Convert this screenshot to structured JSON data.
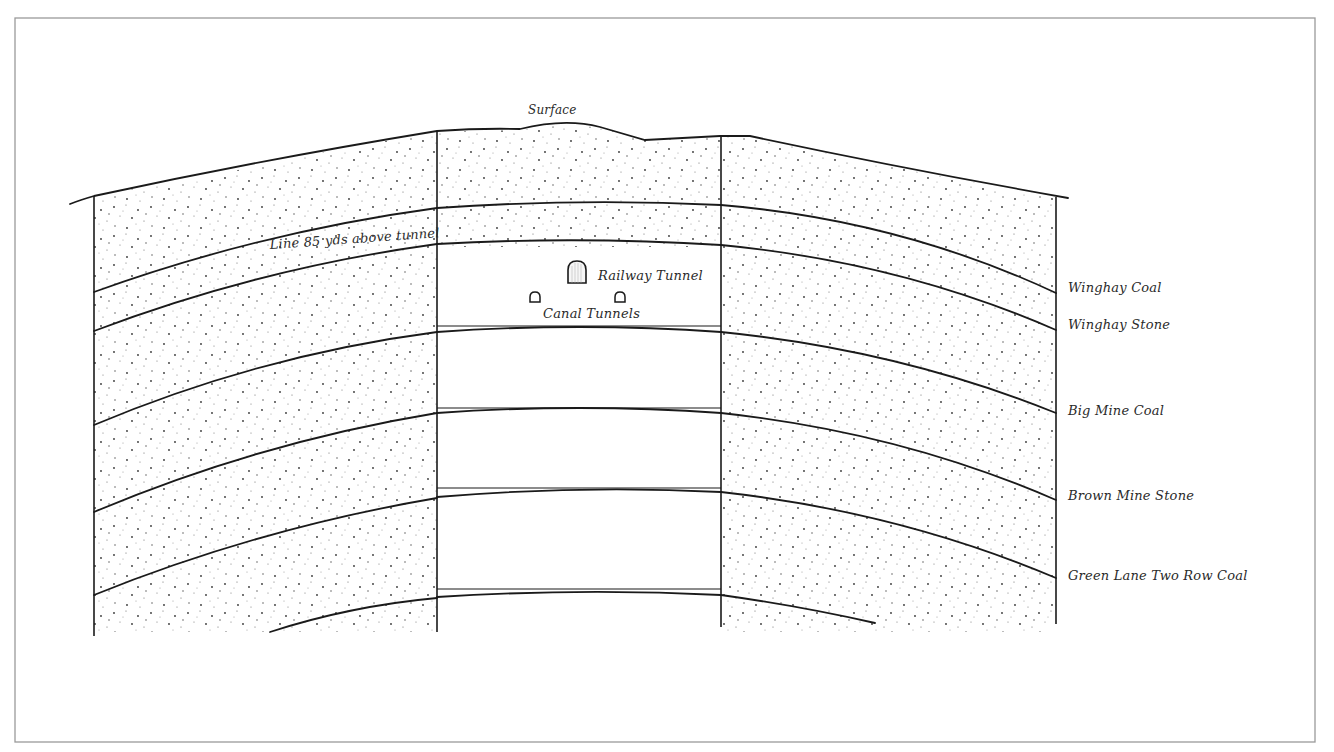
{
  "diagram": {
    "type": "geological cross-section",
    "surface_label": "Surface",
    "annotation_line": "Line 85 yds above tunnel",
    "tunnels": {
      "railway_label": "Railway Tunnel",
      "canal_label": "Canal Tunnels",
      "railway_icon": "arched-tunnel-large",
      "canal_icons": [
        "arched-tunnel-small",
        "arched-tunnel-small"
      ]
    },
    "strata_labels": [
      "Winghay Coal",
      "Winghay Stone",
      "Big Mine Coal",
      "Brown Mine Stone",
      "Green Lane Two Row Coal"
    ],
    "colors": {
      "line": "#1a1a1a",
      "frame": "#9a9a9a",
      "stipple": "#333333",
      "background": "#ffffff"
    }
  }
}
